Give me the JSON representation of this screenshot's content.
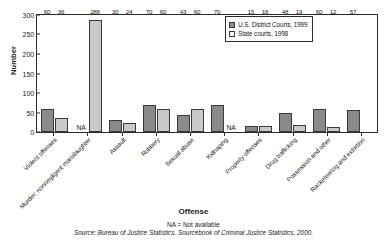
{
  "chart_data": {
    "type": "bar",
    "title": "",
    "xlabel": "Offense",
    "ylabel": "Number",
    "ylim": [
      0,
      300
    ],
    "yticks": [
      0,
      50,
      100,
      150,
      200,
      250,
      300
    ],
    "grid": false,
    "legend_position": "top-right",
    "categories": [
      "Violent offenses",
      "Murder: nonnegligent manslaughter",
      "Assault",
      "Robbery",
      "Sexual abuse",
      "Kidnaping",
      "Property offenses",
      "Drug trafficking",
      "Possession and other",
      "Racketeering and extortion"
    ],
    "series": [
      {
        "name": "U.S. District Courts, 1999",
        "color": "#8a8a8a",
        "values": [
          60,
          null,
          30,
          70,
          43,
          70,
          15,
          48,
          60,
          57
        ],
        "labels": [
          "60",
          "NA",
          "30",
          "70",
          "43",
          "70",
          "15",
          "48",
          "60",
          "57"
        ]
      },
      {
        "name": "State courts, 1998",
        "color": "#c9c9c9",
        "values": [
          36,
          288,
          24,
          60,
          60,
          null,
          16,
          19,
          12,
          null
        ],
        "labels": [
          "36",
          "288",
          "24",
          "60",
          "60",
          "NA",
          "16",
          "19",
          "12",
          ""
        ]
      }
    ],
    "annotations": [
      "NA = Not available",
      "Source: Bureau of Justice Statistics. Sourcebook of Criminal Justice Statistics, 2000."
    ]
  },
  "footer": {
    "na_note": "NA = Not available",
    "source": "Source: Bureau of Justice Statistics. Sourcebook of Criminal Justice Statistics, 2000."
  }
}
